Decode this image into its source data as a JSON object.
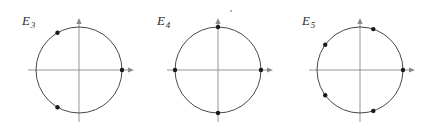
{
  "figure": {
    "panel_width": 146,
    "panel_height": 133,
    "colors": {
      "background": "#ffffff",
      "axis": "#8a8a8a",
      "circle": "#333333",
      "point": "#1a1a1a",
      "label": "#2b2b2b",
      "speck": "#9a9a9a"
    },
    "geometry": {
      "radius": 43,
      "center_y": 70,
      "axis_x_start_offset": -51,
      "axis_x_end_offset": 55,
      "axis_y_top_offset": -52,
      "axis_y_bottom_offset": 52,
      "point_radius": 2.2,
      "circle_stroke": 0.9,
      "axis_stroke": 0.9
    },
    "artifact": {
      "name": "stray-speck",
      "x": 230,
      "y": 10
    }
  },
  "chart_data": {
    "type": "scatter",
    "xlabel": "",
    "ylabel": "",
    "xlim": [
      -1.25,
      1.25
    ],
    "ylim": [
      -1.25,
      1.25
    ],
    "grid": false,
    "legend": null,
    "panels": [
      {
        "name": "E3",
        "label_base": "E",
        "label_sub": "3",
        "center_x": 79,
        "n": 3,
        "start_angle_deg": 0,
        "angles_deg": [
          0,
          120,
          240
        ],
        "points": [
          {
            "angle_deg": 0,
            "x": 1.0,
            "y": 0.0
          },
          {
            "angle_deg": 120,
            "x": -0.5,
            "y": 0.866
          },
          {
            "angle_deg": 240,
            "x": -0.5,
            "y": -0.866
          }
        ]
      },
      {
        "name": "E4",
        "label_base": "E",
        "label_sub": "4",
        "center_x": 218,
        "n": 4,
        "start_angle_deg": 0,
        "angles_deg": [
          0,
          90,
          180,
          270
        ],
        "points": [
          {
            "angle_deg": 0,
            "x": 1.0,
            "y": 0.0
          },
          {
            "angle_deg": 90,
            "x": 0.0,
            "y": 1.0
          },
          {
            "angle_deg": 180,
            "x": -1.0,
            "y": 0.0
          },
          {
            "angle_deg": 270,
            "x": 0.0,
            "y": -1.0
          }
        ]
      },
      {
        "name": "E5",
        "label_base": "E",
        "label_sub": "5",
        "center_x": 360,
        "n": 5,
        "start_angle_deg": 0,
        "angles_deg": [
          0,
          72,
          144,
          216,
          288
        ],
        "points": [
          {
            "angle_deg": 0,
            "x": 1.0,
            "y": 0.0
          },
          {
            "angle_deg": 72,
            "x": 0.309,
            "y": 0.951
          },
          {
            "angle_deg": 144,
            "x": -0.809,
            "y": 0.588
          },
          {
            "angle_deg": 216,
            "x": -0.809,
            "y": -0.588
          },
          {
            "angle_deg": 288,
            "x": 0.309,
            "y": -0.951
          }
        ]
      }
    ],
    "labels": [
      {
        "panel": "E3",
        "text": "E",
        "subscript": "3",
        "x": 22,
        "y": 14
      },
      {
        "panel": "E4",
        "text": "E",
        "subscript": "4",
        "x": 157,
        "y": 14
      },
      {
        "panel": "E5",
        "text": "E",
        "subscript": "5",
        "x": 302,
        "y": 14
      }
    ]
  }
}
